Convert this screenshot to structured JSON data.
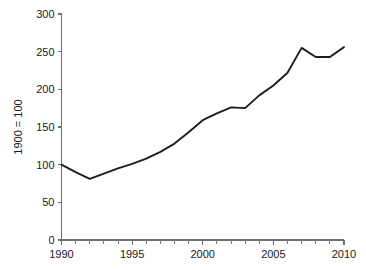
{
  "chart_data": {
    "type": "line",
    "title": "",
    "subtitle": "",
    "xlabel": "",
    "ylabel": "1900 = 100",
    "x": [
      1990,
      1991,
      1992,
      1993,
      1994,
      1995,
      1996,
      1997,
      1998,
      1999,
      2000,
      2001,
      2002,
      2003,
      2004,
      2005,
      2006,
      2007,
      2008,
      2009,
      2010
    ],
    "values": [
      100,
      90,
      81,
      88,
      95,
      101,
      108,
      117,
      128,
      143,
      159,
      168,
      176,
      175,
      192,
      205,
      222,
      255,
      243,
      243,
      256
    ],
    "series": [
      {
        "name": "index",
        "color": "#1d1d1d",
        "values": [
          100,
          90,
          81,
          88,
          95,
          101,
          108,
          117,
          128,
          143,
          159,
          168,
          176,
          175,
          192,
          205,
          222,
          255,
          243,
          243,
          256
        ]
      }
    ],
    "xlim": [
      1990,
      2010
    ],
    "ylim": [
      0,
      300
    ],
    "x_ticks_major": [
      1990,
      1995,
      2000,
      2005,
      2010
    ],
    "x_tick_labels": [
      "1990",
      "1995",
      "2000",
      "2005",
      "2010"
    ],
    "x_ticks_minor": [
      1991,
      1992,
      1993,
      1994,
      1996,
      1997,
      1998,
      1999,
      2001,
      2002,
      2003,
      2004,
      2006,
      2007,
      2008,
      2009
    ],
    "y_ticks": [
      0,
      50,
      100,
      150,
      200,
      250,
      300
    ],
    "y_tick_labels": [
      "0",
      "50",
      "100",
      "150",
      "200",
      "250",
      "300"
    ],
    "grid": false,
    "legend": false,
    "legend_position": "none",
    "annotations": [],
    "axis_color": "#6e6e6e",
    "background_color": "#ffffff"
  }
}
